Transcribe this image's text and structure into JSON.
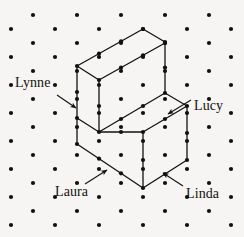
{
  "figure": {
    "background_color": "#f6f5f3",
    "ink_color": "#14120f",
    "dot_color": "#111111",
    "dot_radius": 2.1,
    "line_width": 1.3,
    "width": 244,
    "height": 237
  },
  "lattice": {
    "description": "triangular (isometric) dot lattice",
    "x_spacing": 22,
    "y_spacing": 14,
    "x_origin": 11,
    "y_origin": 15,
    "columns_per_row": 6,
    "rows": 16,
    "points": [
      [
        33,
        15
      ],
      [
        77,
        15
      ],
      [
        121,
        15
      ],
      [
        165,
        15
      ],
      [
        209,
        15
      ],
      [
        11,
        29
      ],
      [
        55,
        29
      ],
      [
        99,
        29
      ],
      [
        143,
        29
      ],
      [
        187,
        29
      ],
      [
        231,
        29
      ],
      [
        33,
        43
      ],
      [
        77,
        43
      ],
      [
        121,
        43
      ],
      [
        165,
        43
      ],
      [
        209,
        43
      ],
      [
        11,
        57
      ],
      [
        55,
        57
      ],
      [
        99,
        57
      ],
      [
        143,
        57
      ],
      [
        187,
        57
      ],
      [
        231,
        57
      ],
      [
        33,
        71
      ],
      [
        77,
        71
      ],
      [
        121,
        71
      ],
      [
        165,
        71
      ],
      [
        209,
        71
      ],
      [
        11,
        85
      ],
      [
        55,
        85
      ],
      [
        99,
        85
      ],
      [
        143,
        85
      ],
      [
        187,
        85
      ],
      [
        231,
        85
      ],
      [
        33,
        99
      ],
      [
        77,
        99
      ],
      [
        121,
        99
      ],
      [
        165,
        99
      ],
      [
        209,
        99
      ],
      [
        11,
        113
      ],
      [
        55,
        113
      ],
      [
        99,
        113
      ],
      [
        143,
        113
      ],
      [
        187,
        113
      ],
      [
        231,
        113
      ],
      [
        33,
        127
      ],
      [
        77,
        127
      ],
      [
        121,
        127
      ],
      [
        165,
        127
      ],
      [
        209,
        127
      ],
      [
        11,
        141
      ],
      [
        55,
        141
      ],
      [
        99,
        141
      ],
      [
        143,
        141
      ],
      [
        187,
        141
      ],
      [
        231,
        141
      ],
      [
        33,
        155
      ],
      [
        77,
        155
      ],
      [
        121,
        155
      ],
      [
        165,
        155
      ],
      [
        209,
        155
      ],
      [
        11,
        169
      ],
      [
        55,
        169
      ],
      [
        99,
        169
      ],
      [
        143,
        169
      ],
      [
        187,
        169
      ],
      [
        231,
        169
      ],
      [
        33,
        183
      ],
      [
        77,
        183
      ],
      [
        121,
        183
      ],
      [
        165,
        183
      ],
      [
        209,
        183
      ],
      [
        11,
        197
      ],
      [
        55,
        197
      ],
      [
        99,
        197
      ],
      [
        143,
        197
      ],
      [
        187,
        197
      ],
      [
        231,
        197
      ],
      [
        33,
        211
      ],
      [
        77,
        211
      ],
      [
        121,
        211
      ],
      [
        165,
        211
      ],
      [
        209,
        211
      ],
      [
        11,
        225
      ],
      [
        55,
        225
      ],
      [
        99,
        225
      ],
      [
        143,
        225
      ],
      [
        187,
        225
      ],
      [
        231,
        225
      ]
    ]
  },
  "solid": {
    "name": "step-solid",
    "vertices": {
      "A_top_back": [
        143,
        29
      ],
      "B_top_right": [
        165,
        42
      ],
      "C_top_left": [
        77,
        66
      ],
      "D_top_front": [
        99,
        80
      ],
      "E_left_lower": [
        77,
        118
      ],
      "F_mid_front": [
        99,
        132
      ],
      "G_step_right": [
        165,
        93
      ],
      "H_step_front": [
        187,
        106
      ],
      "I_bottom_left": [
        77,
        144
      ],
      "J_bottom_front": [
        143,
        188
      ],
      "K_bottom_right": [
        187,
        160
      ],
      "L_mid_joint": [
        143,
        160
      ]
    },
    "edges": [
      {
        "name": "top-face-back-left",
        "from": [
          143,
          29
        ],
        "to": [
          77,
          66
        ]
      },
      {
        "name": "top-face-back-right",
        "from": [
          143,
          29
        ],
        "to": [
          165,
          42
        ]
      },
      {
        "name": "top-face-front-left",
        "from": [
          77,
          66
        ],
        "to": [
          99,
          80
        ]
      },
      {
        "name": "top-face-front-right",
        "from": [
          99,
          80
        ],
        "to": [
          165,
          43
        ]
      },
      {
        "name": "upper-left-vertical",
        "from": [
          77,
          66
        ],
        "to": [
          77,
          118
        ]
      },
      {
        "name": "upper-front-vertical",
        "from": [
          99,
          80
        ],
        "to": [
          99,
          132
        ]
      },
      {
        "name": "upper-right-vertical",
        "from": [
          165,
          42
        ],
        "to": [
          165,
          93
        ]
      },
      {
        "name": "step-left-edge",
        "from": [
          77,
          118
        ],
        "to": [
          99,
          132
        ]
      },
      {
        "name": "step-top-right",
        "from": [
          99,
          132
        ],
        "to": [
          165,
          93
        ]
      },
      {
        "name": "step-face-right",
        "from": [
          165,
          93
        ],
        "to": [
          187,
          106
        ]
      },
      {
        "name": "step-top-front",
        "from": [
          187,
          106
        ],
        "to": [
          143,
          132
        ]
      },
      {
        "name": "step-front-left",
        "from": [
          143,
          132
        ],
        "to": [
          99,
          132
        ]
      },
      {
        "name": "lower-left-vertical",
        "from": [
          77,
          118
        ],
        "to": [
          77,
          144
        ]
      },
      {
        "name": "lower-front-vertical",
        "from": [
          143,
          132
        ],
        "to": [
          143,
          188
        ]
      },
      {
        "name": "lower-right-vertical",
        "from": [
          187,
          106
        ],
        "to": [
          187,
          160
        ]
      },
      {
        "name": "bottom-left-edge",
        "from": [
          77,
          144
        ],
        "to": [
          143,
          188
        ]
      },
      {
        "name": "bottom-right-edge",
        "from": [
          143,
          188
        ],
        "to": [
          187,
          160
        ]
      }
    ]
  },
  "annotations": [
    {
      "id": "lynne",
      "label": "Lynne",
      "label_x": 15,
      "label_y": 76,
      "arrow_from": [
        57,
        95
      ],
      "arrow_to": [
        76,
        108
      ],
      "points_at": "upper-left-vertical-face"
    },
    {
      "id": "lucy",
      "label": "Lucy",
      "label_x": 194,
      "label_y": 99,
      "arrow_from": [
        191,
        100
      ],
      "arrow_to": [
        168,
        114
      ],
      "points_at": "step-right-face"
    },
    {
      "id": "laura",
      "label": "Laura",
      "label_x": 55,
      "label_y": 185,
      "arrow_from": [
        85,
        184
      ],
      "arrow_to": [
        107,
        170
      ],
      "points_at": "lower-left-front-face"
    },
    {
      "id": "linda",
      "label": "Linda",
      "label_x": 186,
      "label_y": 187,
      "arrow_from": [
        183,
        186
      ],
      "arrow_to": [
        163,
        173
      ],
      "points_at": "lower-right-front-face"
    }
  ]
}
